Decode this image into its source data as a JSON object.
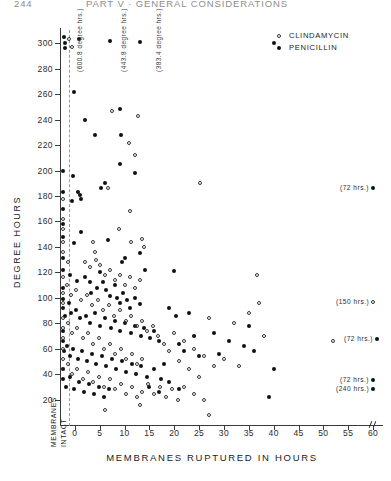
{
  "running_head": {
    "page_number": "244",
    "title": "PART V · GENERAL CONSIDERATIONS"
  },
  "legend": {
    "entries": [
      {
        "label": "CLINDAMYCIN",
        "marker": "open-circle",
        "color": "#333333"
      },
      {
        "label": "PENICILLIN",
        "marker": "filled-circle",
        "color": "#111111"
      }
    ]
  },
  "annotations": {
    "membranes_intact_line1": "MEMBRANES",
    "membranes_intact_line2": "INTACT",
    "degree_callouts": [
      {
        "label": "(600.8 degree hrs.)"
      },
      {
        "label": "(443.8 degree hrs.)"
      },
      {
        "label": "(383.4 degree hrs.)"
      }
    ],
    "side_notes": [
      {
        "label": "(72 hrs.)",
        "marker": "filled-circle"
      },
      {
        "label": "(150 hrs.)",
        "marker": "open-circle"
      },
      {
        "label": "(72 hrs.)",
        "marker": "filled-circle"
      },
      {
        "label": "(72 hrs.)",
        "marker": "filled-circle"
      },
      {
        "label": "(240 hrs.)",
        "marker": "filled-circle"
      }
    ]
  },
  "chart_data": {
    "type": "scatter",
    "title": "",
    "xlabel": "MEMBRANES RUPTURED IN HOURS",
    "ylabel": "DEGREE HOURS",
    "xlim": [
      -3,
      62
    ],
    "ylim": [
      0,
      312
    ],
    "xticks": [
      0,
      5,
      10,
      15,
      20,
      25,
      30,
      35,
      40,
      45,
      50,
      55,
      60
    ],
    "yticks": [
      20,
      40,
      60,
      80,
      100,
      120,
      140,
      160,
      180,
      200,
      220,
      240,
      260,
      280,
      300
    ],
    "grid": false,
    "legend_position": "top-right",
    "reference_line": {
      "x": 0,
      "style": "dashed",
      "label": "membranes intact boundary"
    },
    "series": [
      {
        "name": "PENICILLIN",
        "marker": "filled-circle",
        "points": [
          [
            -2.2,
            305
          ],
          [
            -2.0,
            300
          ],
          [
            -1.9,
            296
          ],
          [
            0.8,
            303
          ],
          [
            7.0,
            302
          ],
          [
            13.0,
            301
          ],
          [
            -0.2,
            262
          ],
          [
            2.0,
            240
          ],
          [
            -2.4,
            200
          ],
          [
            -2.4,
            183
          ],
          [
            -0.4,
            196
          ],
          [
            0.6,
            183
          ],
          [
            1.0,
            181
          ],
          [
            -2.4,
            170
          ],
          [
            -0.6,
            176
          ],
          [
            1.2,
            178
          ],
          [
            -2.3,
            158
          ],
          [
            -2.3,
            148
          ],
          [
            -0.2,
            143
          ],
          [
            1.3,
            152
          ],
          [
            4.0,
            228
          ],
          [
            9.0,
            248
          ],
          [
            9.2,
            228
          ],
          [
            9.0,
            205
          ],
          [
            5.2,
            186
          ],
          [
            6.0,
            190
          ],
          [
            12.0,
            198
          ],
          [
            6.6,
            145
          ],
          [
            9.4,
            128
          ],
          [
            10.0,
            131
          ],
          [
            13.0,
            135
          ],
          [
            14.2,
            122
          ],
          [
            20.0,
            121
          ],
          [
            -2.4,
            131
          ],
          [
            -2.4,
            122
          ],
          [
            -1.0,
            118
          ],
          [
            0.4,
            113
          ],
          [
            2.0,
            116
          ],
          [
            3.0,
            112
          ],
          [
            3.2,
            104
          ],
          [
            4.4,
            108
          ],
          [
            5.0,
            120
          ],
          [
            5.6,
            112
          ],
          [
            6.2,
            106
          ],
          [
            7.0,
            101
          ],
          [
            8.0,
            110
          ],
          [
            8.4,
            100
          ],
          [
            9.0,
            96
          ],
          [
            9.6,
            104
          ],
          [
            10.4,
            98
          ],
          [
            11.0,
            92
          ],
          [
            12.0,
            100
          ],
          [
            13.0,
            95
          ],
          [
            -2.4,
            108
          ],
          [
            -2.4,
            99
          ],
          [
            -2.4,
            92
          ],
          [
            -2.0,
            86
          ],
          [
            -1.2,
            96
          ],
          [
            -0.8,
            88
          ],
          [
            0.2,
            90
          ],
          [
            1.0,
            84
          ],
          [
            2.2,
            86
          ],
          [
            3.0,
            80
          ],
          [
            4.0,
            88
          ],
          [
            5.0,
            78
          ],
          [
            6.0,
            84
          ],
          [
            7.2,
            76
          ],
          [
            8.0,
            82
          ],
          [
            9.0,
            74
          ],
          [
            10.0,
            80
          ],
          [
            11.2,
            72
          ],
          [
            12.0,
            78
          ],
          [
            13.4,
            70
          ],
          [
            14.0,
            76
          ],
          [
            15.2,
            68
          ],
          [
            16.0,
            74
          ],
          [
            17.0,
            66
          ],
          [
            -2.4,
            74
          ],
          [
            -2.4,
            66
          ],
          [
            -2.2,
            58
          ],
          [
            -1.6,
            62
          ],
          [
            -1.0,
            54
          ],
          [
            -0.4,
            60
          ],
          [
            0.6,
            52
          ],
          [
            1.4,
            58
          ],
          [
            2.4,
            50
          ],
          [
            3.4,
            56
          ],
          [
            4.2,
            48
          ],
          [
            5.4,
            54
          ],
          [
            6.2,
            46
          ],
          [
            7.4,
            52
          ],
          [
            8.2,
            44
          ],
          [
            9.4,
            50
          ],
          [
            10.2,
            42
          ],
          [
            11.4,
            48
          ],
          [
            12.2,
            40
          ],
          [
            13.4,
            46
          ],
          [
            -2.4,
            44
          ],
          [
            -2.4,
            36
          ],
          [
            -1.8,
            30
          ],
          [
            -1.0,
            38
          ],
          [
            -0.2,
            28
          ],
          [
            0.8,
            34
          ],
          [
            1.8,
            26
          ],
          [
            2.8,
            32
          ],
          [
            3.8,
            24
          ],
          [
            4.8,
            30
          ],
          [
            5.8,
            22
          ],
          [
            6.8,
            28
          ],
          [
            19.0,
            92
          ],
          [
            20.4,
            86
          ],
          [
            21.0,
            64
          ],
          [
            22.0,
            58
          ],
          [
            23.0,
            88
          ],
          [
            24.0,
            70
          ],
          [
            25.0,
            54
          ],
          [
            28.0,
            72
          ],
          [
            29.0,
            56
          ],
          [
            31.0,
            66
          ],
          [
            34.0,
            62
          ],
          [
            35.0,
            78
          ],
          [
            36.0,
            58
          ],
          [
            40.0,
            300
          ],
          [
            40.0,
            44
          ],
          [
            39.0,
            22
          ],
          [
            14.6,
            38
          ],
          [
            16.0,
            44
          ],
          [
            17.4,
            36
          ],
          [
            18.0,
            48
          ],
          [
            15.0,
            30
          ],
          [
            17.0,
            26
          ],
          [
            19.0,
            34
          ],
          [
            21.0,
            28
          ]
        ]
      },
      {
        "name": "CLINDAMYCIN",
        "marker": "open-circle",
        "points": [
          [
            -1.2,
            303
          ],
          [
            -0.6,
            297
          ],
          [
            7.4,
            247
          ],
          [
            12.6,
            243
          ],
          [
            -2.4,
            178
          ],
          [
            -2.4,
            162
          ],
          [
            -2.4,
            154
          ],
          [
            6.6,
            186
          ],
          [
            25.2,
            190
          ],
          [
            10.8,
            222
          ],
          [
            12.0,
            212
          ],
          [
            11.0,
            168
          ],
          [
            8.8,
            154
          ],
          [
            11.2,
            144
          ],
          [
            13.6,
            146
          ],
          [
            14.0,
            140
          ],
          [
            3.6,
            144
          ],
          [
            4.0,
            136
          ],
          [
            -2.4,
            144
          ],
          [
            -2.4,
            136
          ],
          [
            -1.4,
            128
          ],
          [
            2.0,
            128
          ],
          [
            3.0,
            124
          ],
          [
            4.2,
            130
          ],
          [
            5.0,
            126
          ],
          [
            6.0,
            118
          ],
          [
            7.0,
            122
          ],
          [
            8.0,
            114
          ],
          [
            9.0,
            118
          ],
          [
            10.0,
            110
          ],
          [
            11.0,
            116
          ],
          [
            12.0,
            108
          ],
          [
            13.0,
            114
          ],
          [
            36.6,
            118
          ],
          [
            37.0,
            96
          ],
          [
            -2.4,
            116
          ],
          [
            -2.4,
            104
          ],
          [
            -2.4,
            96
          ],
          [
            -1.6,
            110
          ],
          [
            -0.8,
            102
          ],
          [
            0.2,
            106
          ],
          [
            1.2,
            98
          ],
          [
            2.4,
            102
          ],
          [
            3.4,
            94
          ],
          [
            4.6,
            98
          ],
          [
            5.6,
            90
          ],
          [
            6.8,
            94
          ],
          [
            7.8,
            86
          ],
          [
            9.0,
            90
          ],
          [
            10.2,
            82
          ],
          [
            11.2,
            86
          ],
          [
            12.4,
            78
          ],
          [
            13.6,
            82
          ],
          [
            14.6,
            74
          ],
          [
            15.8,
            78
          ],
          [
            16.8,
            70
          ],
          [
            -2.4,
            84
          ],
          [
            -2.4,
            76
          ],
          [
            -2.4,
            68
          ],
          [
            -1.4,
            80
          ],
          [
            -0.6,
            72
          ],
          [
            0.4,
            76
          ],
          [
            1.6,
            68
          ],
          [
            2.6,
            72
          ],
          [
            3.6,
            64
          ],
          [
            4.8,
            68
          ],
          [
            5.8,
            60
          ],
          [
            7.0,
            64
          ],
          [
            8.0,
            56
          ],
          [
            9.2,
            60
          ],
          [
            10.2,
            52
          ],
          [
            11.4,
            56
          ],
          [
            12.4,
            48
          ],
          [
            13.6,
            52
          ],
          [
            -2.4,
            60
          ],
          [
            -2.4,
            52
          ],
          [
            -2.4,
            44
          ],
          [
            -1.4,
            48
          ],
          [
            -0.6,
            40
          ],
          [
            0.4,
            44
          ],
          [
            1.6,
            36
          ],
          [
            2.6,
            42
          ],
          [
            3.6,
            34
          ],
          [
            4.8,
            38
          ],
          [
            5.8,
            30
          ],
          [
            7.0,
            36
          ],
          [
            8.0,
            28
          ],
          [
            9.2,
            32
          ],
          [
            10.2,
            24
          ],
          [
            11.4,
            30
          ],
          [
            12.4,
            22
          ],
          [
            13.6,
            26
          ],
          [
            14.8,
            32
          ],
          [
            16.0,
            24
          ],
          [
            17.2,
            30
          ],
          [
            18.4,
            22
          ],
          [
            19.6,
            28
          ],
          [
            20.8,
            20
          ],
          [
            18.0,
            64
          ],
          [
            19.0,
            58
          ],
          [
            20.0,
            72
          ],
          [
            21.0,
            50
          ],
          [
            22.0,
            66
          ],
          [
            23.0,
            44
          ],
          [
            24.0,
            60
          ],
          [
            25.0,
            38
          ],
          [
            26.0,
            54
          ],
          [
            27.0,
            84
          ],
          [
            28.0,
            46
          ],
          [
            30.0,
            52
          ],
          [
            32.0,
            80
          ],
          [
            33.0,
            46
          ],
          [
            35.0,
            88
          ],
          [
            38.0,
            70
          ],
          [
            52.0,
            66
          ],
          [
            6.0,
            12
          ],
          [
            13.0,
            16
          ],
          [
            22.0,
            30
          ],
          [
            24.0,
            24
          ],
          [
            26.0,
            20
          ],
          [
            27.0,
            8
          ]
        ]
      }
    ]
  }
}
